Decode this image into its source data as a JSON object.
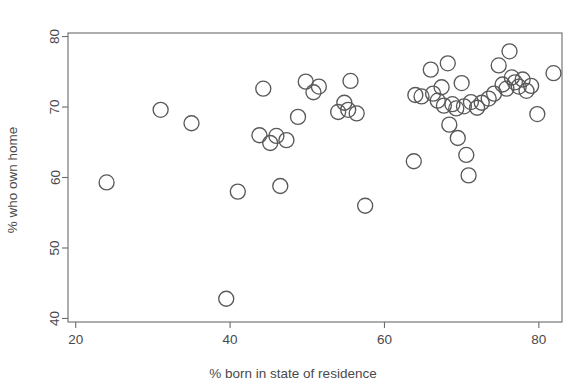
{
  "chart_data": {
    "type": "scatter",
    "title": "",
    "xlabel": "% born in state of residence",
    "ylabel": "% who own home",
    "xlim": [
      19,
      83
    ],
    "ylim": [
      39.5,
      80.5
    ],
    "xticks": [
      20,
      40,
      60,
      80
    ],
    "yticks": [
      40,
      50,
      60,
      70,
      80
    ],
    "grid": false,
    "legend": null,
    "marker": "open-circle",
    "marker_color": "#595959",
    "marker_radius_px": 7.5,
    "points": [
      {
        "x": 24.0,
        "y": 59.3
      },
      {
        "x": 31.0,
        "y": 69.6
      },
      {
        "x": 35.0,
        "y": 67.7
      },
      {
        "x": 39.5,
        "y": 42.8
      },
      {
        "x": 41.0,
        "y": 58.0
      },
      {
        "x": 43.8,
        "y": 66.0
      },
      {
        "x": 44.3,
        "y": 72.6
      },
      {
        "x": 45.2,
        "y": 64.9
      },
      {
        "x": 46.0,
        "y": 65.9
      },
      {
        "x": 46.5,
        "y": 58.8
      },
      {
        "x": 47.3,
        "y": 65.3
      },
      {
        "x": 48.8,
        "y": 68.6
      },
      {
        "x": 49.8,
        "y": 73.6
      },
      {
        "x": 50.8,
        "y": 72.1
      },
      {
        "x": 51.5,
        "y": 72.9
      },
      {
        "x": 54.0,
        "y": 69.3
      },
      {
        "x": 54.8,
        "y": 70.6
      },
      {
        "x": 55.3,
        "y": 69.6
      },
      {
        "x": 55.6,
        "y": 73.7
      },
      {
        "x": 56.4,
        "y": 69.1
      },
      {
        "x": 57.5,
        "y": 56.0
      },
      {
        "x": 63.8,
        "y": 62.3
      },
      {
        "x": 64.0,
        "y": 71.7
      },
      {
        "x": 64.8,
        "y": 71.5
      },
      {
        "x": 66.0,
        "y": 75.3
      },
      {
        "x": 66.3,
        "y": 71.9
      },
      {
        "x": 66.9,
        "y": 70.9
      },
      {
        "x": 67.4,
        "y": 72.8
      },
      {
        "x": 67.7,
        "y": 70.2
      },
      {
        "x": 68.2,
        "y": 76.2
      },
      {
        "x": 68.4,
        "y": 67.5
      },
      {
        "x": 68.8,
        "y": 70.4
      },
      {
        "x": 69.3,
        "y": 69.8
      },
      {
        "x": 69.5,
        "y": 65.6
      },
      {
        "x": 70.0,
        "y": 73.4
      },
      {
        "x": 70.3,
        "y": 70.1
      },
      {
        "x": 70.6,
        "y": 63.2
      },
      {
        "x": 70.9,
        "y": 60.3
      },
      {
        "x": 71.2,
        "y": 70.7
      },
      {
        "x": 72.0,
        "y": 69.9
      },
      {
        "x": 72.6,
        "y": 70.6
      },
      {
        "x": 73.5,
        "y": 71.2
      },
      {
        "x": 74.2,
        "y": 71.9
      },
      {
        "x": 74.8,
        "y": 75.9
      },
      {
        "x": 75.3,
        "y": 73.2
      },
      {
        "x": 75.8,
        "y": 72.6
      },
      {
        "x": 76.2,
        "y": 77.9
      },
      {
        "x": 76.5,
        "y": 74.2
      },
      {
        "x": 76.9,
        "y": 73.5
      },
      {
        "x": 77.4,
        "y": 72.9
      },
      {
        "x": 77.9,
        "y": 73.9
      },
      {
        "x": 78.4,
        "y": 72.3
      },
      {
        "x": 79.0,
        "y": 73.0
      },
      {
        "x": 79.8,
        "y": 69.0
      },
      {
        "x": 81.9,
        "y": 74.8
      }
    ]
  },
  "axes": {
    "x_label": "% born in state of residence",
    "y_label": "% who own home",
    "x_tick_labels": [
      "20",
      "40",
      "60",
      "80"
    ],
    "y_tick_labels": [
      "40",
      "50",
      "60",
      "70",
      "80"
    ]
  }
}
